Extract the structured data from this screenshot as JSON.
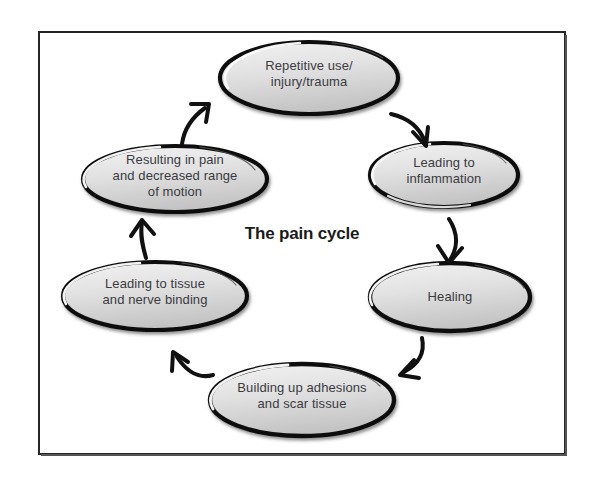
{
  "diagram": {
    "title": "The pain cycle",
    "frame": {
      "border_color": "#262626",
      "background": "#ffffff"
    },
    "style": {
      "node_fill_light": "#eeeeee",
      "node_fill_dark": "#c9c9c9",
      "node_stroke": "#111111",
      "node_highlight": "#ffffff",
      "text_color": "#3b3b42",
      "arrow_color": "#111111"
    },
    "nodes": [
      {
        "id": "repetitive-use",
        "label": "Repetitive use/\ninjury/trauma",
        "cx": 309,
        "cy": 78,
        "rx": 89,
        "ry": 36
      },
      {
        "id": "leading-to-inflammation",
        "label": "Leading to\ninflammation",
        "cx": 444,
        "cy": 175,
        "rx": 74,
        "ry": 32
      },
      {
        "id": "healing",
        "label": "Healing",
        "cx": 450,
        "cy": 297,
        "rx": 80,
        "ry": 34
      },
      {
        "id": "building-up-adhesions",
        "label": "Building up adhesions\nand scar tissue",
        "cx": 302,
        "cy": 400,
        "rx": 92,
        "ry": 36
      },
      {
        "id": "leading-to-tissue",
        "label": "Leading to tissue\nand nerve binding",
        "cx": 155,
        "cy": 296,
        "rx": 92,
        "ry": 34
      },
      {
        "id": "resulting-in-pain",
        "label": "Resulting in pain\nand decreased range\nof motion",
        "cx": 175,
        "cy": 179,
        "rx": 92,
        "ry": 33
      }
    ],
    "arrows": [
      {
        "id": "arrow-repetitive-to-inflammation",
        "from": "repetitive-use",
        "to": "leading-to-inflammation",
        "direction": "down-right"
      },
      {
        "id": "arrow-inflammation-to-healing",
        "from": "leading-to-inflammation",
        "to": "healing",
        "direction": "down"
      },
      {
        "id": "arrow-healing-to-adhesions",
        "from": "healing",
        "to": "building-up-adhesions",
        "direction": "down-left"
      },
      {
        "id": "arrow-adhesions-to-tissue",
        "from": "building-up-adhesions",
        "to": "leading-to-tissue",
        "direction": "up-left"
      },
      {
        "id": "arrow-tissue-to-pain",
        "from": "leading-to-tissue",
        "to": "resulting-in-pain",
        "direction": "up"
      },
      {
        "id": "arrow-pain-to-repetitive",
        "from": "resulting-in-pain",
        "to": "repetitive-use",
        "direction": "up-right"
      }
    ]
  }
}
